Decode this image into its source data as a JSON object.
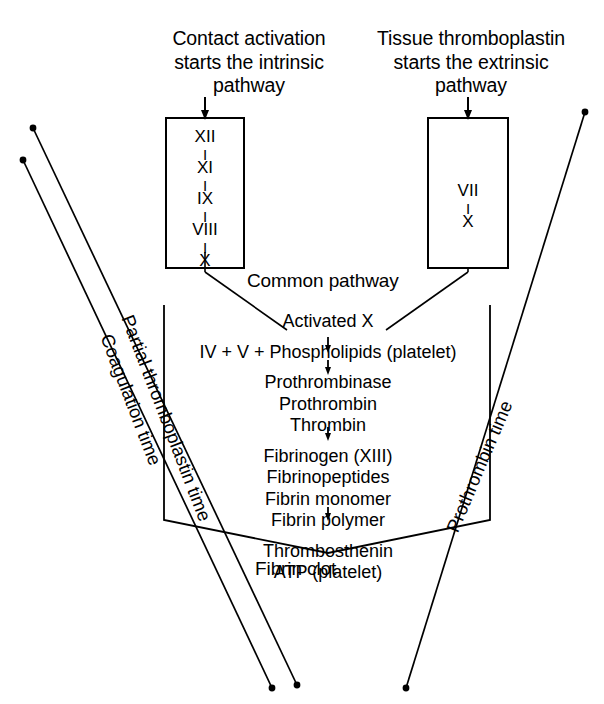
{
  "diagram": {
    "headers": {
      "left": "Contact activation\nstarts the intrinsic\npathway",
      "right": "Tissue thromboplastin\nstarts the extrinsic\npathway"
    },
    "intrinsic_box": {
      "name": "intrinsic pathway box",
      "factors": [
        "XII",
        "XI",
        "IX",
        "VIII",
        "X"
      ],
      "connector": "I"
    },
    "extrinsic_box": {
      "name": "extrinsic pathway box",
      "factors": [
        "VII",
        "X"
      ],
      "connector": "I"
    },
    "common_pathway": {
      "label": "Common pathway",
      "steps": [
        "Activated X",
        "IV + V + Phospholipids (platelet)",
        "Prothrombinase",
        "Prothrombin",
        "Thrombin",
        "Fibrinogen (XIII)",
        "Fibrinopeptides",
        "Fibrin monomer",
        "Fibrin polymer",
        "Thrombosthenin",
        "ATP    (platelet)"
      ],
      "result": "Fibrin clot"
    },
    "time_labels": {
      "partial_thromboplastin_time": "Partial thromboplastin time",
      "coagulation_time": "Coagulation time",
      "prothrombin_time": "Prothrombin time"
    },
    "colors": {
      "ink": "#000000",
      "background": "#ffffff"
    }
  }
}
